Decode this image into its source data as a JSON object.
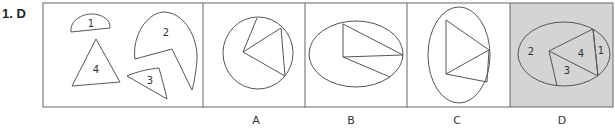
{
  "question": {
    "number": "1.",
    "answer": "D"
  },
  "figure": {
    "source_shapes": [
      {
        "id": "1",
        "shape": "half-disc"
      },
      {
        "id": "2",
        "shape": "ellipse-sector"
      },
      {
        "id": "3",
        "shape": "curved-triangle"
      },
      {
        "id": "4",
        "shape": "triangle"
      }
    ],
    "options": [
      {
        "label": "A",
        "shape": "circle with inscribed triangle sector",
        "highlighted": false
      },
      {
        "label": "B",
        "shape": "horizontal ellipse with triangle sector",
        "highlighted": false
      },
      {
        "label": "C",
        "shape": "vertical ellipse with triangle",
        "highlighted": false
      },
      {
        "label": "D",
        "shape": "ellipse assembled from pieces 1-4",
        "highlighted": true,
        "piece_labels": [
          "2",
          "4",
          "1",
          "3"
        ]
      }
    ],
    "colors": {
      "stroke": "#555555",
      "highlight_bg": "#d4d4d4",
      "panel_bg": "#ffffff"
    }
  }
}
